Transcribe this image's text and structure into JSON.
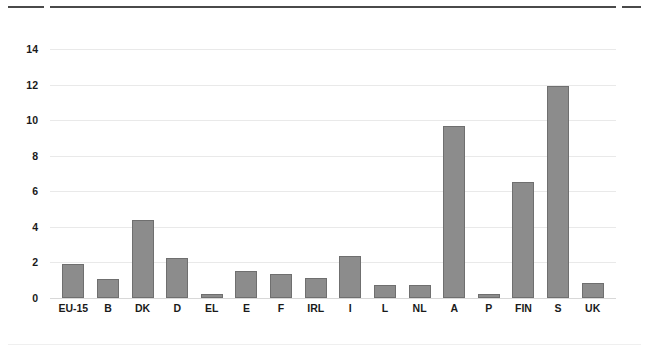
{
  "chart_data": {
    "type": "bar",
    "title": "",
    "subtitle": "",
    "xlabel": "",
    "ylabel": "",
    "categories": [
      "EU-15",
      "B",
      "DK",
      "D",
      "EL",
      "E",
      "F",
      "IRL",
      "I",
      "L",
      "NL",
      "A",
      "P",
      "FIN",
      "S",
      "UK"
    ],
    "values": [
      1.9,
      1.05,
      4.4,
      2.25,
      0.25,
      1.5,
      1.35,
      1.15,
      2.35,
      0.75,
      0.75,
      9.65,
      0.25,
      6.5,
      11.9,
      0.85
    ],
    "series": [
      {
        "name": "value",
        "values": [
          1.9,
          1.05,
          4.4,
          2.25,
          0.25,
          1.5,
          1.35,
          1.15,
          2.35,
          0.75,
          0.75,
          9.65,
          0.25,
          6.5,
          11.9,
          0.85
        ]
      }
    ],
    "ylim": [
      0,
      14
    ],
    "xlim": null,
    "yticks": [
      0,
      2,
      4,
      6,
      8,
      10,
      12,
      14
    ],
    "ytick_labels": [
      "0",
      "2",
      "4",
      "6",
      "8",
      "10",
      "12",
      "14"
    ],
    "grid": true,
    "grid_axis": "y",
    "legend": false,
    "legend_position": "none",
    "annotations": [],
    "colors": {
      "bar_fill": "#8c8c8c",
      "bar_stroke": "#6f6f6f",
      "gridline": "#e9e9e9",
      "baseline": "#d8d8d8",
      "text": "#1a1a1a",
      "top_rule": "#4a4a4a",
      "bottom_rule": "#efefef",
      "background": "#ffffff"
    }
  }
}
